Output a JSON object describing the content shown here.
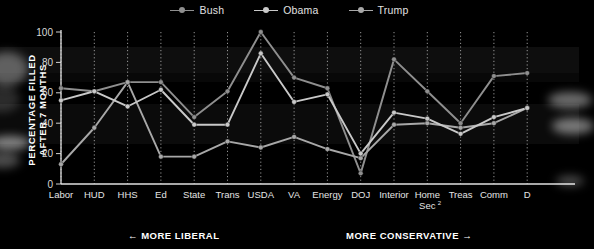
{
  "legend": {
    "items": [
      {
        "label": "Bush",
        "color": "#8f8f8f"
      },
      {
        "label": "Obama",
        "color": "#c9c9c9"
      },
      {
        "label": "Trump",
        "color": "#a8a8a8"
      }
    ]
  },
  "axis": {
    "y_title_line1": "PERCENTAGE FILLED",
    "y_title_line2": "AFTER 7 MONTHS",
    "y_ticks": [
      "0",
      "20",
      "40",
      "60",
      "80",
      "100"
    ]
  },
  "annotations": {
    "liberal": "←  MORE LIBERAL",
    "conservative": "MORE CONSERVATIVE  →"
  },
  "chart_data": {
    "type": "line",
    "title": "",
    "xlabel": "",
    "ylabel": "PERCENTAGE FILLED AFTER 7 MONTHS",
    "ylim": [
      0,
      100
    ],
    "yticks": [
      0,
      20,
      40,
      60,
      80,
      100
    ],
    "grid": "vertical-dotted",
    "legend_position": "top-center",
    "categories": [
      "Labor",
      "HUD",
      "HHS",
      "Ed",
      "State",
      "Trans",
      "USDA",
      "VA",
      "Energy",
      "DOJ",
      "Interior",
      "Home Sec²",
      "Treas",
      "Comm",
      "D"
    ],
    "series": [
      {
        "name": "Bush",
        "color": "#8f8f8f",
        "values": [
          63,
          61,
          67,
          67,
          44,
          61,
          100,
          70,
          63,
          7,
          82,
          61,
          40,
          71,
          73
        ]
      },
      {
        "name": "Obama",
        "color": "#c9c9c9",
        "values": [
          55,
          61,
          51,
          62,
          39,
          39,
          86,
          54,
          59,
          20,
          47,
          43,
          33,
          44,
          50
        ]
      },
      {
        "name": "Trump",
        "color": "#a8a8a8",
        "values": [
          13,
          37,
          67,
          18,
          18,
          28,
          24,
          31,
          23,
          17,
          39,
          40,
          37,
          40,
          50
        ]
      }
    ],
    "notes": {
      "x_direction_left": "MORE LIBERAL",
      "x_direction_right": "MORE CONSERVATIVE",
      "last_category_truncated": true
    }
  }
}
